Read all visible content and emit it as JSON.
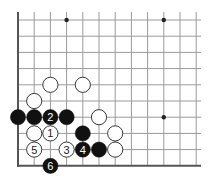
{
  "diagram": {
    "type": "go-board-corner",
    "corner": "bottom-left",
    "visible_columns": 12,
    "visible_rows": 10,
    "colors": {
      "background": "#ffffff",
      "edge_line": "#555555",
      "grid_line": "#9a9a9a",
      "black_stone": "#111111",
      "white_stone": "#ffffff",
      "white_stone_outline": "#222222",
      "label_on_black": "#ffffff",
      "label_on_white": "#222222",
      "star_point": "#222222"
    },
    "star_points": [
      {
        "col": 3,
        "row": 0
      },
      {
        "col": 9,
        "row": 0
      },
      {
        "col": 9,
        "row": 6
      }
    ],
    "stones": [
      {
        "color": "white",
        "col": 2,
        "row": 4,
        "label": ""
      },
      {
        "color": "white",
        "col": 4,
        "row": 4,
        "label": ""
      },
      {
        "color": "white",
        "col": 1,
        "row": 5,
        "label": ""
      },
      {
        "color": "black",
        "col": 0,
        "row": 6,
        "label": ""
      },
      {
        "color": "black",
        "col": 1,
        "row": 6,
        "label": ""
      },
      {
        "color": "black",
        "col": 2,
        "row": 6,
        "label": "2"
      },
      {
        "color": "black",
        "col": 3,
        "row": 6,
        "label": ""
      },
      {
        "color": "white",
        "col": 5,
        "row": 6,
        "label": ""
      },
      {
        "color": "white",
        "col": 1,
        "row": 7,
        "label": ""
      },
      {
        "color": "white",
        "col": 2,
        "row": 7,
        "label": "1"
      },
      {
        "color": "black",
        "col": 4,
        "row": 7,
        "label": ""
      },
      {
        "color": "white",
        "col": 6,
        "row": 7,
        "label": ""
      },
      {
        "color": "white",
        "col": 1,
        "row": 8,
        "label": "5"
      },
      {
        "color": "white",
        "col": 3,
        "row": 8,
        "label": "3"
      },
      {
        "color": "black",
        "col": 4,
        "row": 8,
        "label": "4"
      },
      {
        "color": "black",
        "col": 5,
        "row": 8,
        "label": ""
      },
      {
        "color": "white",
        "col": 6,
        "row": 8,
        "label": ""
      },
      {
        "color": "black",
        "col": 2,
        "row": 9,
        "label": "6"
      }
    ]
  }
}
